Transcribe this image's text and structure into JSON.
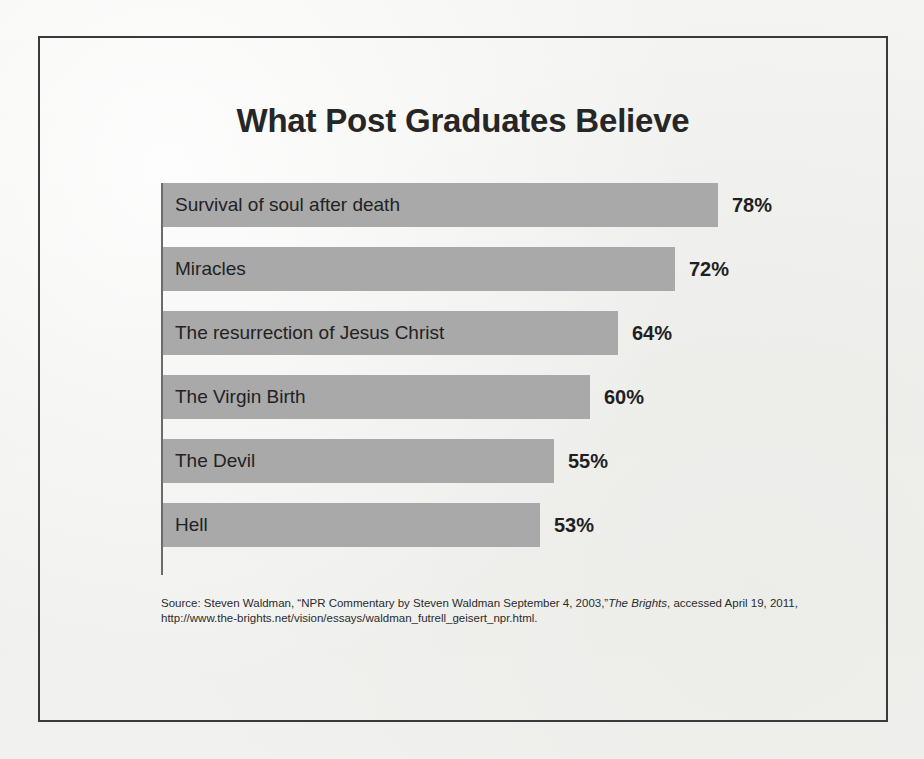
{
  "slide": {
    "title": "What Post Graduates Believe",
    "border_color": "#3a3a3a",
    "background_color": "#f2f2f0"
  },
  "chart_data": {
    "type": "bar",
    "orientation": "horizontal",
    "title": "What Post Graduates Believe",
    "xlabel": "",
    "ylabel": "",
    "xlim": [
      0,
      90
    ],
    "grid": false,
    "legend": "none",
    "bar_color": "#a9a9a9",
    "axis_color": "#6b6b6b",
    "categories": [
      "Survival of soul after death",
      "Miracles",
      "The resurrection of Jesus Christ",
      "The Virgin Birth",
      "The Devil",
      "Hell"
    ],
    "values": [
      78,
      72,
      64,
      60,
      55,
      53
    ],
    "value_labels": [
      "78%",
      "72%",
      "64%",
      "60%",
      "55%",
      "53%"
    ],
    "bars": [
      {
        "label": "Survival of soul after death",
        "value": 78,
        "value_label": "78%"
      },
      {
        "label": "Miracles",
        "value": 72,
        "value_label": "72%"
      },
      {
        "label": "The resurrection of Jesus Christ",
        "value": 64,
        "value_label": "64%"
      },
      {
        "label": "The Virgin Birth",
        "value": 60,
        "value_label": "60%"
      },
      {
        "label": "The Devil",
        "value": 55,
        "value_label": "55%"
      },
      {
        "label": "Hell",
        "value": 53,
        "value_label": "53%"
      }
    ]
  },
  "source": {
    "line1_pre": "Source: Steven Waldman, “NPR Commentary by Steven Waldman September 4, 2003,”",
    "line1_italic": "The Brights",
    "line1_post": ",",
    "line2": "accessed April 19, 2011, http://www.the-brights.net/vision/essays/waldman_futrell_geisert_npr.html."
  }
}
